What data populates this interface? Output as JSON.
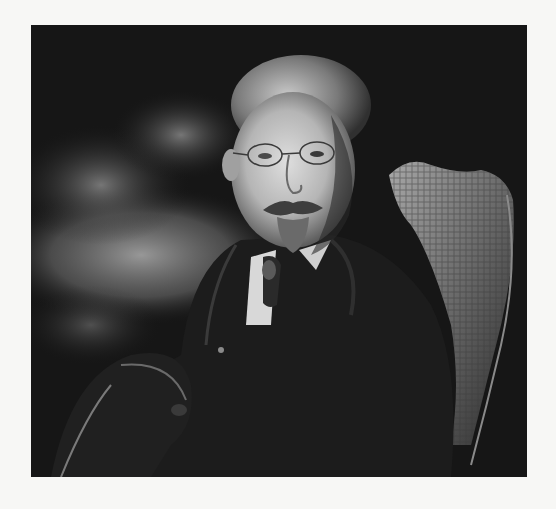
{
  "image": {
    "type": "photograph",
    "style": "black-and-white studio portrait",
    "subject": "older man with glasses, mustache and goatee, seated in wicker chair, wearing dark suit and tie",
    "colors": {
      "page_background": "#f7f7f5",
      "photo_dark": "#141414",
      "background_cloud": "#8a8a8a",
      "skin_light": "#cfcfcf",
      "chair_highlight": "#9a9a9a"
    }
  }
}
